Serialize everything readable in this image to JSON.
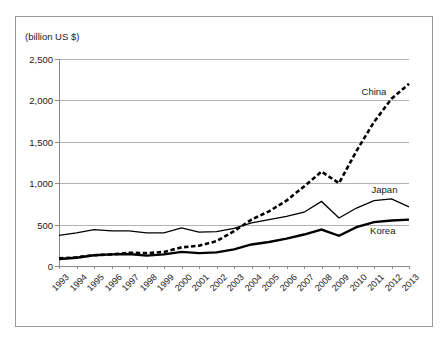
{
  "axis_unit_label": "(billion US $)",
  "chart_data": {
    "type": "line",
    "title": "",
    "subtitle": "",
    "xlabel": "",
    "ylabel": "(billion US $)",
    "unit": "billion US $",
    "grid": true,
    "legend_position": "inline-end-labels",
    "xlim": [
      1993,
      2013
    ],
    "ylim": [
      0,
      2500
    ],
    "ytick_labels": [
      "0",
      "500",
      "1,000",
      "1,500",
      "2,000",
      "2,500"
    ],
    "ytick_values": [
      0,
      500,
      1000,
      1500,
      2000,
      2500
    ],
    "categories": [
      1993,
      1994,
      1995,
      1996,
      1997,
      1998,
      1999,
      2000,
      2001,
      2002,
      2003,
      2004,
      2005,
      2006,
      2007,
      2008,
      2009,
      2010,
      2011,
      2012,
      2013
    ],
    "xtick_labels": [
      "1993",
      "1994",
      "1995",
      "1996",
      "1997",
      "1998",
      "1999",
      "2000",
      "2001",
      "2002",
      "2003",
      "2004",
      "2005",
      "2006",
      "2007",
      "2008",
      "2009",
      "2010",
      "2011",
      "2012",
      "2013"
    ],
    "series": [
      {
        "name": "China",
        "style": "dashed",
        "width": 2.6,
        "color": "#000000",
        "values": [
          92,
          105,
          130,
          140,
          160,
          155,
          170,
          225,
          245,
          300,
          420,
          560,
          660,
          790,
          960,
          1140,
          1000,
          1390,
          1740,
          2020,
          2200
        ]
      },
      {
        "name": "Japan",
        "style": "solid",
        "width": 1.3,
        "color": "#000000",
        "values": [
          370,
          400,
          440,
          425,
          425,
          400,
          400,
          460,
          410,
          415,
          455,
          520,
          560,
          600,
          650,
          780,
          580,
          700,
          790,
          810,
          715
        ]
      },
      {
        "name": "Korea",
        "style": "solid",
        "width": 2.4,
        "color": "#000000",
        "values": [
          85,
          100,
          130,
          140,
          145,
          125,
          140,
          170,
          155,
          165,
          200,
          260,
          290,
          330,
          380,
          440,
          365,
          470,
          530,
          550,
          560
        ]
      }
    ],
    "series_label_points": [
      {
        "name": "China",
        "x": 2011.0,
        "y": 2110
      },
      {
        "name": "Japan",
        "x": 2011.6,
        "y": 930
      },
      {
        "name": "Korea",
        "x": 2011.5,
        "y": 430
      }
    ]
  }
}
